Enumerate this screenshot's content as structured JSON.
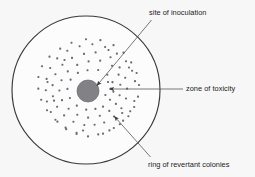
{
  "figure": {
    "type": "diagram",
    "background_color": "#f7f7f7",
    "plate": {
      "name": "agar-plate-outline",
      "center_x": 86,
      "center_y": 90,
      "radius": 74,
      "stroke_color": "#3a3a3a",
      "stroke_width": 1.15,
      "fill_color": "#fcfcfc"
    },
    "inoculation_disc": {
      "name": "inoculation-disc",
      "center_x": 88,
      "center_y": 91,
      "radius": 11,
      "fill_color": "#818186",
      "stroke_color": "#6d6d72"
    },
    "colony_ring": {
      "name": "revertant-colony-ring",
      "inner_radius": 21,
      "outer_radius": 49,
      "dot_size": 2.1,
      "dot_color": "#6f6f77",
      "count": 108
    },
    "colonies": [
      [
        92.4,
        44.2
      ],
      [
        105.1,
        47.0
      ],
      [
        79.6,
        46.3
      ],
      [
        67.3,
        50.8
      ],
      [
        116.9,
        53.6
      ],
      [
        57.2,
        58.4
      ],
      [
        126.0,
        61.3
      ],
      [
        50.2,
        68.0
      ],
      [
        132.1,
        70.8
      ],
      [
        46.6,
        78.9
      ],
      [
        135.0,
        81.1
      ],
      [
        45.8,
        90.2
      ],
      [
        46.9,
        101.5
      ],
      [
        134.3,
        101.0
      ],
      [
        50.8,
        112.0
      ],
      [
        130.2,
        111.2
      ],
      [
        57.4,
        121.6
      ],
      [
        123.1,
        120.6
      ],
      [
        66.2,
        129.1
      ],
      [
        113.8,
        128.0
      ],
      [
        76.6,
        134.0
      ],
      [
        103.0,
        133.6
      ],
      [
        88.0,
        136.4
      ],
      [
        95.6,
        52.4
      ],
      [
        84.0,
        53.9
      ],
      [
        72.0,
        57.9
      ],
      [
        110.5,
        57.2
      ],
      [
        62.4,
        64.8
      ],
      [
        119.6,
        67.4
      ],
      [
        55.4,
        74.2
      ],
      [
        125.2,
        77.8
      ],
      [
        52.6,
        85.1
      ],
      [
        127.1,
        88.6
      ],
      [
        52.9,
        96.3
      ],
      [
        126.0,
        98.5
      ],
      [
        57.1,
        106.8
      ],
      [
        121.4,
        108.2
      ],
      [
        64.1,
        115.4
      ],
      [
        114.0,
        116.5
      ],
      [
        73.4,
        121.8
      ],
      [
        104.2,
        122.5
      ],
      [
        84.3,
        125.0
      ],
      [
        94.6,
        124.8
      ],
      [
        100.2,
        60.6
      ],
      [
        88.6,
        61.4
      ],
      [
        77.2,
        64.9
      ],
      [
        67.8,
        71.4
      ],
      [
        112.0,
        65.8
      ],
      [
        118.6,
        74.6
      ],
      [
        61.5,
        80.3
      ],
      [
        120.3,
        84.8
      ],
      [
        59.4,
        90.5
      ],
      [
        119.6,
        95.2
      ],
      [
        62.0,
        100.1
      ],
      [
        115.9,
        103.9
      ],
      [
        68.6,
        108.8
      ],
      [
        109.3,
        110.9
      ],
      [
        77.3,
        114.8
      ],
      [
        99.8,
        115.8
      ],
      [
        88.1,
        117.6
      ],
      [
        98.2,
        70.0
      ],
      [
        87.5,
        70.2
      ],
      [
        77.9,
        72.9
      ],
      [
        70.6,
        79.6
      ],
      [
        107.3,
        74.8
      ],
      [
        112.5,
        82.1
      ],
      [
        67.4,
        88.9
      ],
      [
        113.4,
        91.7
      ],
      [
        69.9,
        98.0
      ],
      [
        110.0,
        99.8
      ],
      [
        76.8,
        105.6
      ],
      [
        103.0,
        106.6
      ],
      [
        86.2,
        109.6
      ],
      [
        95.4,
        108.9
      ],
      [
        100.4,
        40.1
      ],
      [
        86.0,
        39.3
      ],
      [
        71.5,
        42.8
      ],
      [
        113.5,
        45.1
      ],
      [
        60.2,
        48.6
      ],
      [
        123.5,
        52.6
      ],
      [
        49.5,
        56.6
      ],
      [
        131.2,
        62.4
      ],
      [
        42.0,
        66.2
      ],
      [
        136.6,
        73.0
      ],
      [
        38.4,
        77.0
      ],
      [
        139.0,
        85.0
      ],
      [
        38.3,
        88.6
      ],
      [
        138.0,
        96.6
      ],
      [
        41.2,
        99.8
      ],
      [
        134.2,
        107.0
      ],
      [
        47.0,
        110.2
      ],
      [
        128.4,
        116.2
      ],
      [
        55.4,
        119.8
      ],
      [
        119.8,
        124.2
      ],
      [
        65.6,
        127.6
      ],
      [
        109.4,
        130.4
      ],
      [
        76.6,
        132.8
      ],
      [
        98.2,
        134.4
      ],
      [
        110.8,
        88.6
      ],
      [
        105.4,
        95.0
      ],
      [
        108.0,
        82.0
      ],
      [
        64.5,
        60.0
      ],
      [
        108.5,
        50.0
      ],
      [
        54.0,
        100.6
      ],
      [
        129.0,
        67.5
      ],
      [
        47.5,
        82.0
      ],
      [
        122.2,
        113.0
      ],
      [
        83.0,
        130.5
      ]
    ],
    "annotations": [
      {
        "id": "site",
        "name": "site-of-inoculation",
        "label": "site of inoculation",
        "label_x": 149,
        "label_y": 8,
        "line": {
          "x1": 151.5,
          "y1": 20.0,
          "x2": 97.0,
          "y2": 85.5
        },
        "arrow_at": "end",
        "color": "#4d4d4d"
      },
      {
        "id": "zone",
        "name": "zone-of-toxicity",
        "label": "zone of toxicity",
        "label_x": 186,
        "label_y": 84,
        "line": {
          "x1": 183.0,
          "y1": 89.0,
          "x2": 109.5,
          "y2": 89.0
        },
        "arrow_at": "end",
        "color": "#4d4d4d"
      },
      {
        "id": "ring",
        "name": "ring-of-revertant-colonies",
        "label": "ring of revertant colonies",
        "label_x": 148,
        "label_y": 160,
        "line": {
          "x1": 150.5,
          "y1": 157.0,
          "x2": 114.5,
          "y2": 116.5
        },
        "arrow_at": "end",
        "color": "#4d4d4d"
      }
    ]
  }
}
